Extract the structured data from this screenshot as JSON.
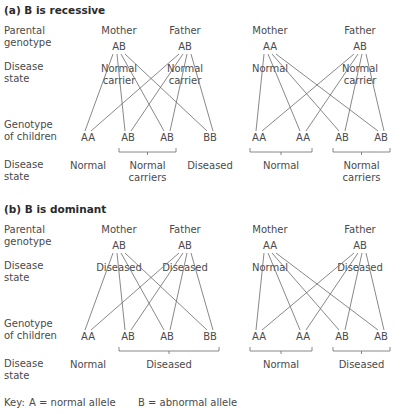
{
  "panels": [
    {
      "title": "(a) B is recessive",
      "row_labels": {
        "parental": [
          "Parental",
          "genotype"
        ],
        "disease_parent": [
          "Disease",
          "state"
        ],
        "children": [
          "Genotype",
          "of children"
        ],
        "disease_children": [
          "Disease",
          "state"
        ]
      },
      "crosses": [
        {
          "mother": {
            "label": "Mother",
            "genotype": "AB",
            "state": [
              "Normal",
              "carrier"
            ]
          },
          "father": {
            "label": "Father",
            "genotype": "AB",
            "state": [
              "Normal",
              "carrier"
            ]
          },
          "children": [
            "AA",
            "AB",
            "AB",
            "BB"
          ],
          "outcomes": [
            {
              "text": [
                "Normal"
              ],
              "span": [
                0,
                0
              ]
            },
            {
              "text": [
                "Normal",
                "carriers"
              ],
              "span": [
                1,
                2
              ]
            },
            {
              "text": [
                "Diseased"
              ],
              "span": [
                3,
                3
              ]
            }
          ]
        },
        {
          "mother": {
            "label": "Mother",
            "genotype": "AA",
            "state": [
              "Normal"
            ]
          },
          "father": {
            "label": "Father",
            "genotype": "AB",
            "state": [
              "Normal",
              "carrier"
            ]
          },
          "children": [
            "AA",
            "AA",
            "AB",
            "AB"
          ],
          "outcomes": [
            {
              "text": [
                "Normal"
              ],
              "span": [
                0,
                1
              ]
            },
            {
              "text": [
                "Normal",
                "carriers"
              ],
              "span": [
                2,
                3
              ]
            }
          ]
        }
      ]
    },
    {
      "title": "(b) B is dominant",
      "row_labels": {
        "parental": [
          "Parental",
          "genotype"
        ],
        "disease_parent": [
          "Disease",
          "state"
        ],
        "children": [
          "Genotype",
          "of children"
        ],
        "disease_children": [
          "Disease",
          "state"
        ]
      },
      "crosses": [
        {
          "mother": {
            "label": "Mother",
            "genotype": "AB",
            "state": [
              "Diseased"
            ]
          },
          "father": {
            "label": "Father",
            "genotype": "AB",
            "state": [
              "Diseased"
            ]
          },
          "children": [
            "AA",
            "AB",
            "AB",
            "BB"
          ],
          "outcomes": [
            {
              "text": [
                "Normal"
              ],
              "span": [
                0,
                0
              ]
            },
            {
              "text": [
                "Diseased"
              ],
              "span": [
                1,
                3
              ]
            }
          ]
        },
        {
          "mother": {
            "label": "Mother",
            "genotype": "AA",
            "state": [
              "Normal"
            ]
          },
          "father": {
            "label": "Father",
            "genotype": "AB",
            "state": [
              "Diseased"
            ]
          },
          "children": [
            "AA",
            "AA",
            "AB",
            "AB"
          ],
          "outcomes": [
            {
              "text": [
                "Normal"
              ],
              "span": [
                0,
                1
              ]
            },
            {
              "text": [
                "Diseased"
              ],
              "span": [
                2,
                3
              ]
            }
          ]
        }
      ]
    }
  ],
  "key": {
    "prefix": "Key:",
    "a": "A = normal allele",
    "b": "B = abnormal allele"
  },
  "colors": {
    "text": "#4a4a4a",
    "lines": "#6a6a6a",
    "background": "#ffffff"
  }
}
